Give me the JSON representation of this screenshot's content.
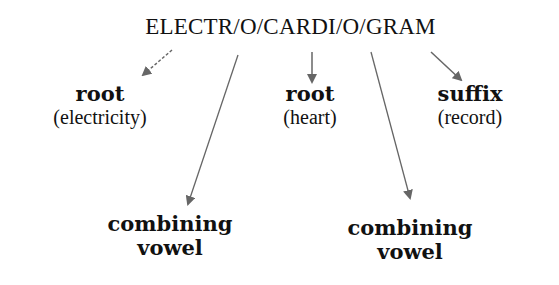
{
  "diagram": {
    "word": "ELECTR/O/CARDI/O/GRAM",
    "parts": [
      {
        "term": "root",
        "meaning": "(electricity)"
      },
      {
        "term": "root",
        "meaning": "(heart)"
      },
      {
        "term": "suffix",
        "meaning": "(record)"
      },
      {
        "term_line1": "combining",
        "term_line2": "vowel"
      },
      {
        "term_line1": "combining",
        "term_line2": "vowel"
      }
    ],
    "colors": {
      "arrow": "#666666",
      "text": "#111111"
    }
  }
}
